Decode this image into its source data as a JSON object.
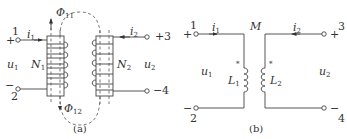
{
  "figure_a": {
    "caption": "(a)",
    "terminals": {
      "t1": "1",
      "t2": "2",
      "t3": "3",
      "t4": "4",
      "plus1": "+",
      "minus2": "−",
      "plus3": "+",
      "minus4": "−"
    },
    "currents": {
      "i1": "i",
      "i1_sub": "1",
      "i2": "i",
      "i2_sub": "2"
    },
    "voltages": {
      "u1": "u",
      "u1_sub": "1",
      "u2": "u",
      "u2_sub": "2"
    },
    "windings": {
      "n1": "N",
      "n1_sub": "1",
      "n2": "N",
      "n2_sub": "2"
    },
    "flux": {
      "phi11": "Φ",
      "phi11_sub": "11",
      "phi12": "Φ",
      "phi12_sub": "12"
    }
  },
  "figure_b": {
    "caption": "(b)",
    "terminals": {
      "t1": "1",
      "t2": "2",
      "t3": "3",
      "t4": "4",
      "plus1": "+",
      "minus2": "−",
      "plus3": "+",
      "minus4": "−"
    },
    "currents": {
      "i1": "i",
      "i1_sub": "1",
      "i2": "i",
      "i2_sub": "2"
    },
    "voltages": {
      "u1": "u",
      "u1_sub": "1",
      "u2": "u",
      "u2_sub": "2"
    },
    "inductors": {
      "l1": "L",
      "l1_sub": "1",
      "l2": "L",
      "l2_sub": "2"
    },
    "mutual": "M",
    "dot_marker": "*"
  }
}
